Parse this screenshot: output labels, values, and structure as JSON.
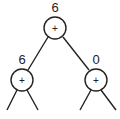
{
  "diagram": {
    "type": "tree",
    "colors": {
      "stroke": "#222222",
      "background": "#ffffff"
    },
    "nodes": [
      {
        "id": "root",
        "operator": "+",
        "value": "6"
      },
      {
        "id": "left",
        "operator": "+",
        "value": "6"
      },
      {
        "id": "right",
        "operator": "+",
        "value": "0"
      }
    ],
    "edges": [
      [
        "root",
        "left"
      ],
      [
        "root",
        "right"
      ]
    ]
  }
}
